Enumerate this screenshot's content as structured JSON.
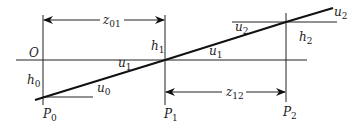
{
  "diagram": {
    "type": "paraxial ray trace through optical surfaces",
    "origin_label": "O",
    "planes": [
      {
        "id": "P0",
        "label": "P",
        "sub": "0",
        "height_label": "h",
        "height_sub": "0"
      },
      {
        "id": "P1",
        "label": "P",
        "sub": "1",
        "height_label": "h",
        "height_sub": "1"
      },
      {
        "id": "P2",
        "label": "P",
        "sub": "2",
        "height_label": "h",
        "height_sub": "2"
      }
    ],
    "angles": [
      {
        "label": "u",
        "sub": "0"
      },
      {
        "label": "u",
        "sub": "1",
        "position": "left of P1"
      },
      {
        "label": "u",
        "sub": "1",
        "position": "right of P1"
      },
      {
        "label": "u",
        "sub": "2",
        "position": "left of P2"
      },
      {
        "label": "u",
        "sub": "2",
        "position": "end of ray"
      }
    ],
    "distances": [
      {
        "label": "z",
        "sub": "01",
        "from": "P0",
        "to": "P1"
      },
      {
        "label": "z",
        "sub": "12",
        "from": "P1",
        "to": "P2"
      }
    ],
    "colors": {
      "line": "#111111",
      "background": "#ffffff"
    }
  }
}
